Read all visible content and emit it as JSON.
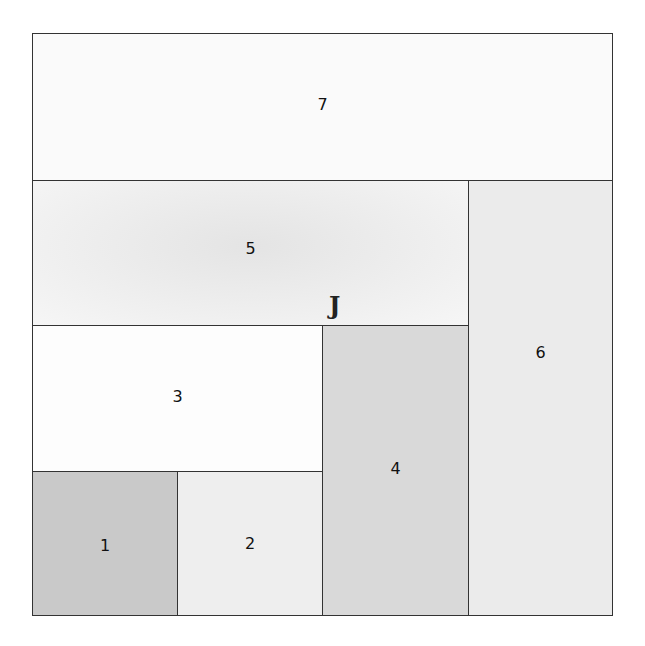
{
  "diagram": {
    "blocks": [
      {
        "id": "1",
        "label": "1",
        "color": "#c9c9c9"
      },
      {
        "id": "2",
        "label": "2",
        "color": "#eeeeee"
      },
      {
        "id": "3",
        "label": "3",
        "color": "#fdfdfd"
      },
      {
        "id": "4",
        "label": "4",
        "color": "#d9d9d9"
      },
      {
        "id": "5",
        "label": "5",
        "color": "#ececec"
      },
      {
        "id": "6",
        "label": "6",
        "color": "#ebebeb"
      },
      {
        "id": "7",
        "label": "7",
        "color": "#fafafa"
      }
    ],
    "annotation": "J"
  }
}
